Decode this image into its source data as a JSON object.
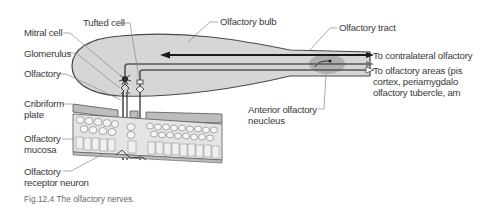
{
  "figure": {
    "caption": "Fig.12.4 The olfactory nerves.",
    "colors": {
      "bulb_fill": "#d6d6d6",
      "outline": "#4a4a4a",
      "nucleus_fill": "#a8a8a8",
      "tissue_fill": "#c9c9c9",
      "cell_fill": "#f2f2f2",
      "arrow": "#1a1a1a"
    }
  },
  "labels": {
    "tufted_cell": "Tufted cell",
    "mitral_cell": "Mitral cell",
    "glomerulus": "Glomerulus",
    "olfactory": "Olfactory",
    "olfactory_bulb": "Olfactory bulb",
    "olfactory_tract": "Olfactory tract",
    "cribriform_plate": [
      "Cribriform",
      "plate"
    ],
    "olfactory_mucosa": [
      "Olfactory",
      "mucosa"
    ],
    "olfactory_receptor_neuron": [
      "Olfactory",
      "receptor neuron"
    ],
    "anterior_olfactory_nucleus": [
      "Anterior olfactory",
      "neucleus"
    ],
    "to_contralateral": "To contralateral olfactory",
    "to_olfactory_areas": [
      "To olfactory areas (pis",
      "cortex, periamygdalo",
      "olfactory tubercle, am"
    ]
  }
}
